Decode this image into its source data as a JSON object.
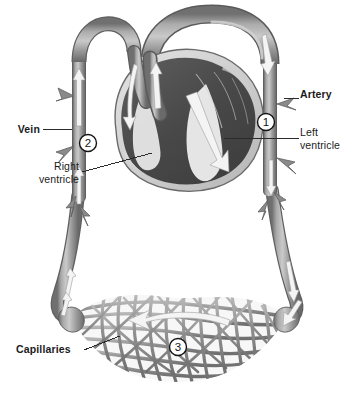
{
  "figure": {
    "kind": "anatomical-diagram",
    "background_color": "#ffffff",
    "ink_color": "#1b1b1b"
  },
  "palette": {
    "vessel_mid": "#8e8e8e",
    "vessel_light": "#bcbcbc",
    "vessel_dark": "#6d6d6d",
    "vessel_outline": "#5a5a5a",
    "heart_muscle_dark": "#4a4a4a",
    "heart_muscle_mid": "#606060",
    "heart_wall_light": "#d8d8d8",
    "chamber_white": "#f2f2f2",
    "arrow_white": "#f4f4f4",
    "label_text": "#1b1b1b",
    "leader_line": "#2b2b2b"
  },
  "labels": [
    {
      "id": "artery",
      "text": "Artery",
      "bold": true,
      "align": "left",
      "x": 300,
      "y": 94
    },
    {
      "id": "left-ventricle",
      "text": "Left\nventricle",
      "bold": false,
      "align": "left",
      "x": 300,
      "y": 128
    },
    {
      "id": "vein",
      "text": "Vein",
      "bold": true,
      "align": "right",
      "x": 42,
      "y": 124
    },
    {
      "id": "right-ventricle",
      "text": "Right\nventricle",
      "bold": false,
      "align": "right",
      "x": 28,
      "y": 166
    },
    {
      "id": "capillaries",
      "text": "Capillaries",
      "bold": true,
      "align": "left",
      "x": 16,
      "y": 347
    }
  ],
  "callouts": [
    {
      "id": "callout-1",
      "number": "1",
      "target": "artery",
      "cx": 266,
      "cy": 122,
      "r": 8.5
    },
    {
      "id": "callout-2",
      "number": "2",
      "target": "vein",
      "cx": 88,
      "cy": 143,
      "r": 8.5
    },
    {
      "id": "callout-3",
      "number": "3",
      "target": "capillaries",
      "cx": 178,
      "cy": 347,
      "r": 8.5
    }
  ],
  "leader_lines": [
    {
      "id": "leader-artery",
      "from": "Artery label",
      "to": "artery vessel"
    },
    {
      "id": "leader-left-ventricle",
      "from": "Left ventricle label",
      "to": "left ventricle chamber"
    },
    {
      "id": "leader-vein",
      "from": "Vein label",
      "to": "vein vessel"
    },
    {
      "id": "leader-right-ventricle",
      "from": "Right ventricle label",
      "to": "right ventricle chamber"
    },
    {
      "id": "leader-capillaries",
      "from": "Capillaries label",
      "to": "capillary bed"
    }
  ],
  "flow": {
    "artery_direction": "downward",
    "vein_direction": "upward",
    "capillary_direction": "right-to-left",
    "heart_internal": "blood flows up and out through the arch"
  },
  "structures": [
    {
      "id": "aortic-arch",
      "name": "aortic arch"
    },
    {
      "id": "vena-cava",
      "name": "vein returning to heart"
    },
    {
      "id": "heart",
      "name": "heart cutaway"
    },
    {
      "id": "artery-trunk",
      "name": "artery"
    },
    {
      "id": "vein-trunk",
      "name": "vein"
    },
    {
      "id": "capillary-bed",
      "name": "capillary bed"
    }
  ]
}
